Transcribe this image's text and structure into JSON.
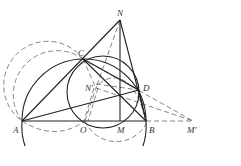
{
  "diagram": {
    "type": "geometry",
    "colors": {
      "solid": "#222222",
      "dashed": "#555555",
      "background": "#ffffff"
    },
    "points": {
      "N": {
        "label": "N",
        "x": 120,
        "y": 20
      },
      "C": {
        "label": "C",
        "x": 83,
        "y": 59
      },
      "D": {
        "label": "D",
        "x": 139,
        "y": 90
      },
      "Np": {
        "label": "N'",
        "x": 96,
        "y": 88
      },
      "A": {
        "label": "A",
        "x": 22,
        "y": 121
      },
      "O": {
        "label": "O",
        "x": 85,
        "y": 121
      },
      "M": {
        "label": "M",
        "x": 120,
        "y": 121
      },
      "B": {
        "label": "B",
        "x": 146,
        "y": 121
      },
      "Mp": {
        "label": "M'",
        "x": 193,
        "y": 121
      },
      "H": {
        "label": "",
        "x": 120,
        "y": 97
      }
    },
    "solid_segments": [
      "A-B",
      "A-N",
      "N-B",
      "N-M",
      "A-D",
      "C-B",
      "C-D",
      "D-B"
    ],
    "dashed_segments": [
      "B-M'",
      "N-N'",
      "C-M'",
      "N'-M'",
      "N'-O",
      "C-N'"
    ],
    "circles": [
      {
        "name": "big-arc",
        "style": "solid",
        "cx": 84,
        "cy": 121,
        "r": 62
      },
      {
        "name": "inner-circle",
        "style": "solid",
        "cx": 104,
        "cy": 90,
        "r": 37
      },
      {
        "name": "left-dashed",
        "style": "dashed",
        "cx": 55,
        "cy": 92,
        "r": 44
      },
      {
        "name": "bottom-dashed",
        "style": "dashed",
        "cx": 115,
        "cy": 113,
        "r": 34
      }
    ]
  }
}
